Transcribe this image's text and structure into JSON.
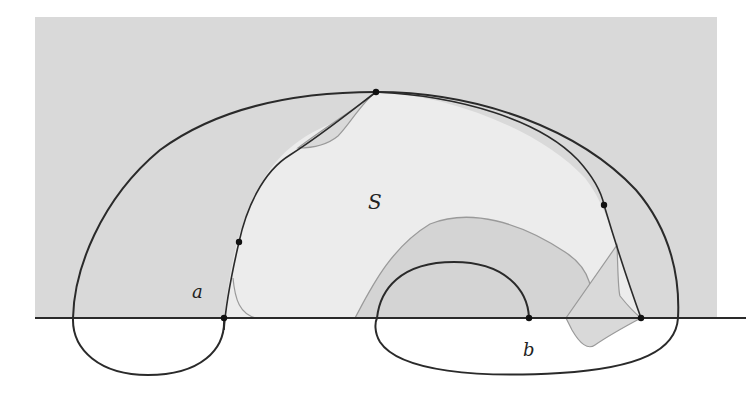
{
  "figure": {
    "type": "geometric-diagram"
  },
  "labels": {
    "S": "S",
    "a": "a",
    "b": "b"
  },
  "colors": {
    "half_plane_fill": "#d9d9d9",
    "region_S_fill": "#ececec",
    "inner_shaded_fill": "#d4d4d4",
    "curve_stroke": "#2a2a2a",
    "light_curve_stroke": "#9a9a9a",
    "axis_stroke": "#2a2a2a",
    "background": "#ffffff"
  },
  "points": [
    {
      "name": "top-point",
      "x": 376,
      "y": 92
    },
    {
      "name": "left-curve-point",
      "x": 239,
      "y": 242
    },
    {
      "name": "right-curve-point",
      "x": 604,
      "y": 205
    },
    {
      "name": "point-a",
      "x": 224,
      "y": 318
    },
    {
      "name": "point-b",
      "x": 529,
      "y": 318
    },
    {
      "name": "right-axis-point",
      "x": 641,
      "y": 318
    }
  ]
}
